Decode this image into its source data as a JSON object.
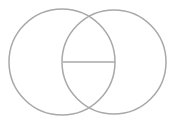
{
  "diagram": {
    "type": "venn",
    "stroke_color": "#a8a8a8",
    "stroke_width": 1.5,
    "circles": [
      {
        "name": "left",
        "cx": 62,
        "cy": 62,
        "r": 53
      },
      {
        "name": "right",
        "cx": 114,
        "cy": 62,
        "r": 52
      }
    ],
    "divider": {
      "x1": 63,
      "y1": 62,
      "x2": 115,
      "y2": 62
    }
  }
}
